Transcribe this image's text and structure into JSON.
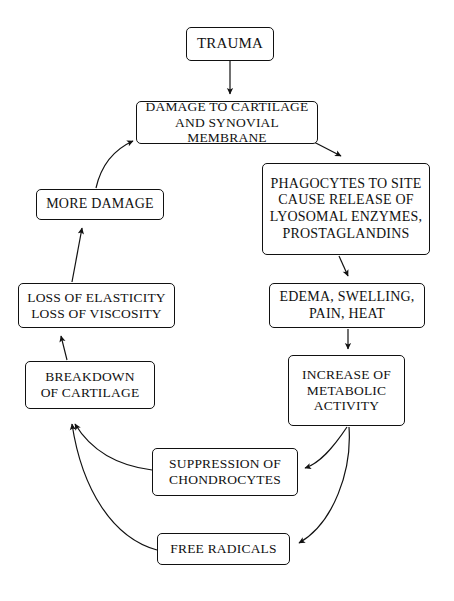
{
  "diagram": {
    "background_color": "#ffffff",
    "line_color": "#111111",
    "text_color": "#111111",
    "nodes": {
      "trauma": "TRAUMA",
      "damage": "DAMAGE TO CARTILAGE\nAND SYNOVIAL MEMBRANE",
      "phagocytes": "PHAGOCYTES TO SITE\nCAUSE RELEASE OF\nLYOSOMAL ENZYMES,\nPROSTAGLANDINS",
      "edema": "EDEMA, SWELLING,\nPAIN, HEAT",
      "increase": "INCREASE OF\nMETABOLIC\nACTIVITY",
      "suppression": "SUPPRESSION OF\nCHONDROCYTES",
      "free_radicals": "FREE RADICALS",
      "breakdown": "BREAKDOWN\nOF CARTILAGE",
      "loss": "LOSS OF ELASTICITY\nLOSS OF VISCOSITY",
      "more_damage": "MORE DAMAGE"
    },
    "edges": [
      {
        "from": "trauma",
        "to": "damage",
        "style": "straight-down"
      },
      {
        "from": "damage",
        "to": "phagocytes",
        "style": "diagonal-down-right"
      },
      {
        "from": "phagocytes",
        "to": "edema",
        "style": "short-down"
      },
      {
        "from": "edema",
        "to": "increase",
        "style": "straight-down"
      },
      {
        "from": "increase",
        "to": "suppression",
        "style": "curve-down-left"
      },
      {
        "from": "increase",
        "to": "free_radicals",
        "style": "curve-down-left-long"
      },
      {
        "from": "suppression",
        "to": "breakdown",
        "style": "curve-up-left"
      },
      {
        "from": "free_radicals",
        "to": "breakdown",
        "style": "curve-up-left-long"
      },
      {
        "from": "breakdown",
        "to": "loss",
        "style": "straight-up"
      },
      {
        "from": "loss",
        "to": "more_damage",
        "style": "straight-up"
      },
      {
        "from": "more_damage",
        "to": "damage",
        "style": "curve-up-right"
      }
    ]
  }
}
